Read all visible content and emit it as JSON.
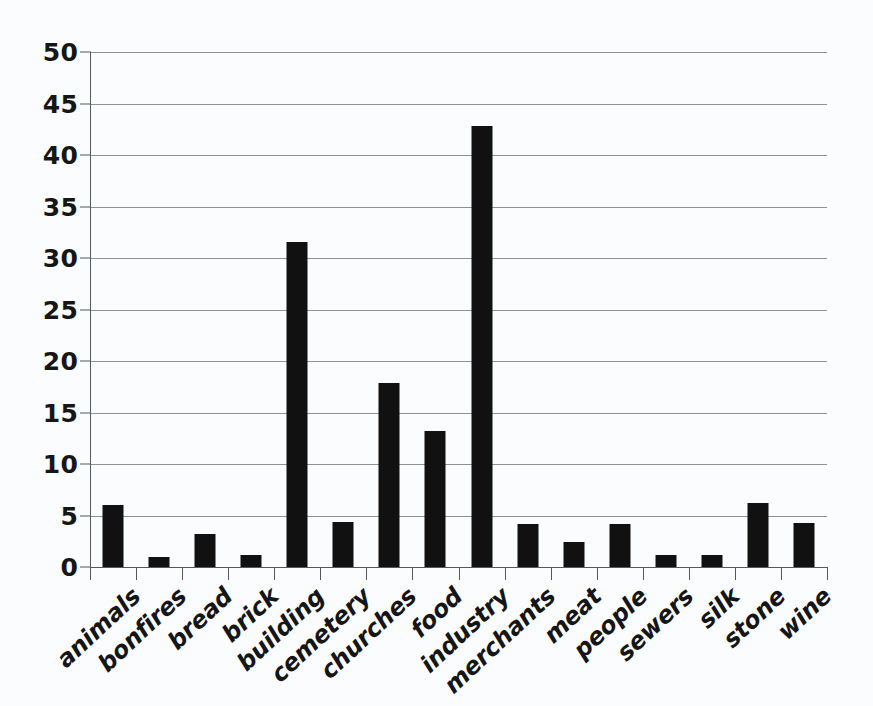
{
  "chart_data": {
    "type": "bar",
    "title": "",
    "subtitle": "",
    "xlabel": "",
    "ylabel": "",
    "ylim": [
      0,
      50
    ],
    "ytick_step": 5,
    "yticks": [
      0,
      5,
      10,
      15,
      20,
      25,
      30,
      35,
      40,
      45,
      50
    ],
    "grid": true,
    "legend": false,
    "legend_position": "none",
    "orientation": "vertical",
    "bar_color": "#111111",
    "gridline_color": "#8c9296",
    "axis_color": "#55595c",
    "background_color": "#fbfcfd",
    "categories": [
      "animals",
      "bonfires",
      "bread",
      "brick",
      "building",
      "cemetery",
      "churches",
      "food",
      "industry",
      "merchants",
      "meat",
      "people",
      "sewers",
      "silk",
      "stone",
      "wine"
    ],
    "values": [
      6.0,
      1.0,
      3.2,
      1.2,
      31.6,
      4.4,
      17.9,
      13.2,
      42.8,
      4.2,
      2.4,
      4.2,
      1.2,
      1.2,
      6.2,
      4.3
    ]
  }
}
